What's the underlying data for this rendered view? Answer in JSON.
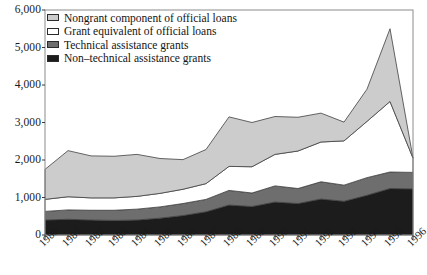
{
  "chart_data": {
    "type": "area",
    "stacked": true,
    "title": "",
    "subtitle": "",
    "xlabel": "",
    "ylabel": "",
    "categories": [
      "1980",
      "1981",
      "1982",
      "1983",
      "1984",
      "1985",
      "1986",
      "1987",
      "1988",
      "1989",
      "1990",
      "1991",
      "1992",
      "1993",
      "1994",
      "1995",
      "1996"
    ],
    "x": [
      1980,
      1981,
      1982,
      1983,
      1984,
      1985,
      1986,
      1987,
      1988,
      1989,
      1990,
      1991,
      1992,
      1993,
      1994,
      1995,
      1996
    ],
    "xlim": [
      1980,
      1996
    ],
    "ylim": [
      0,
      6000
    ],
    "ytick_values": [
      0,
      1000,
      2000,
      3000,
      4000,
      5000,
      6000
    ],
    "ytick_labels": [
      "0",
      "1,000",
      "2,000",
      "3,000",
      "4,000",
      "5,000",
      "6,000"
    ],
    "grid": false,
    "legend_position": "top-left-inside",
    "series": [
      {
        "name": "Non-technical assistance grants",
        "color": "#1c1c1c",
        "order": 1,
        "values": [
          400,
          420,
          400,
          390,
          400,
          450,
          520,
          620,
          800,
          760,
          880,
          840,
          960,
          900,
          1060,
          1240,
          1230
        ]
      },
      {
        "name": "Technical assistance grants",
        "color": "#6e6e6e",
        "order": 2,
        "values": [
          230,
          250,
          260,
          270,
          290,
          300,
          320,
          330,
          390,
          360,
          430,
          400,
          460,
          430,
          470,
          440,
          440
        ]
      },
      {
        "name": "Grant equivalent of official loans",
        "color": "#ffffff",
        "order": 3,
        "values": [
          320,
          350,
          330,
          330,
          340,
          360,
          380,
          420,
          640,
          700,
          840,
          1000,
          1060,
          1180,
          1500,
          1880,
          380
        ]
      },
      {
        "name": "Nongrant component of official loans",
        "color": "#cccccc",
        "order": 4,
        "values": [
          800,
          1230,
          1120,
          1110,
          1120,
          930,
          790,
          910,
          1320,
          1180,
          1010,
          900,
          770,
          500,
          860,
          1940,
          0
        ]
      }
    ],
    "totals": [
      1750,
      2250,
      2110,
      2100,
      2150,
      2040,
      2010,
      2280,
      3150,
      3000,
      3160,
      3140,
      3250,
      3010,
      3890,
      5500,
      2050
    ]
  },
  "legend": {
    "items": [
      {
        "label": "Nongrant component of official loans",
        "swatch": "#cccccc"
      },
      {
        "label": "Grant equivalent of official loans",
        "swatch": "#ffffff"
      },
      {
        "label": "Technical assistance grants",
        "swatch": "#6e6e6e"
      },
      {
        "label": "Non–technical assistance grants",
        "swatch": "#1c1c1c"
      }
    ]
  },
  "axes": {
    "frame_color": "#8c8c8c",
    "tick_color": "#3a3a3a"
  }
}
